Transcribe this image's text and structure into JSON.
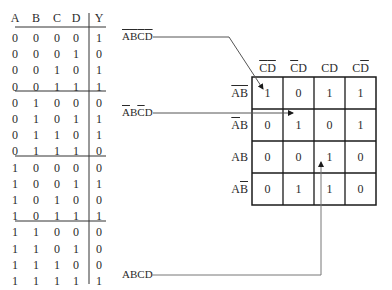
{
  "truth_table": {
    "headers": [
      "A",
      "B",
      "C",
      "D",
      "Y"
    ],
    "rows": [
      [
        "0",
        "0",
        "0",
        "0",
        "1"
      ],
      [
        "0",
        "0",
        "0",
        "1",
        "0"
      ],
      [
        "0",
        "0",
        "1",
        "0",
        "1"
      ],
      [
        "0",
        "0",
        "1",
        "1",
        "1"
      ],
      [
        "0",
        "1",
        "0",
        "0",
        "0"
      ],
      [
        "0",
        "1",
        "0",
        "1",
        "1"
      ],
      [
        "0",
        "1",
        "1",
        "0",
        "1"
      ],
      [
        "0",
        "1",
        "1",
        "1",
        "0"
      ],
      [
        "1",
        "0",
        "0",
        "0",
        "0"
      ],
      [
        "1",
        "0",
        "0",
        "1",
        "1"
      ],
      [
        "1",
        "0",
        "1",
        "0",
        "0"
      ],
      [
        "1",
        "0",
        "1",
        "1",
        "1"
      ],
      [
        "1",
        "1",
        "0",
        "0",
        "0"
      ],
      [
        "1",
        "1",
        "0",
        "1",
        "0"
      ],
      [
        "1",
        "1",
        "1",
        "0",
        "0"
      ],
      [
        "1",
        "1",
        "1",
        "1",
        "1"
      ]
    ]
  },
  "kmap": {
    "col_headers": [
      {
        "parts": [
          {
            "t": "C",
            "bar": true
          },
          {
            "t": "D",
            "bar": true
          }
        ],
        "text": "C̄D̄"
      },
      {
        "parts": [
          {
            "t": "C",
            "bar": true
          },
          {
            "t": "D",
            "bar": false
          }
        ],
        "text": "C̄D"
      },
      {
        "parts": [
          {
            "t": "C",
            "bar": false
          },
          {
            "t": "D",
            "bar": false
          }
        ],
        "text": "CD"
      },
      {
        "parts": [
          {
            "t": "C",
            "bar": false
          },
          {
            "t": "D",
            "bar": true
          }
        ],
        "text": "CD̄"
      }
    ],
    "row_headers": [
      {
        "parts": [
          {
            "t": "A",
            "bar": true
          },
          {
            "t": "B",
            "bar": true
          }
        ],
        "text": "ĀB̄"
      },
      {
        "parts": [
          {
            "t": "A",
            "bar": true
          },
          {
            "t": "B",
            "bar": false
          }
        ],
        "text": "ĀB"
      },
      {
        "parts": [
          {
            "t": "A",
            "bar": false
          },
          {
            "t": "B",
            "bar": false
          }
        ],
        "text": "AB"
      },
      {
        "parts": [
          {
            "t": "A",
            "bar": false
          },
          {
            "t": "B",
            "bar": true
          }
        ],
        "text": "AB̄"
      }
    ],
    "cells": [
      [
        "1",
        "0",
        "1",
        "1"
      ],
      [
        "0",
        "1",
        "0",
        "1"
      ],
      [
        "0",
        "0",
        "1",
        "0"
      ],
      [
        "0",
        "1",
        "1",
        "0"
      ]
    ]
  },
  "annotations": [
    {
      "label": "ĀB̄C̄D̄",
      "parts": [
        {
          "t": "A",
          "bar": true
        },
        {
          "t": "B",
          "bar": true
        },
        {
          "t": "C",
          "bar": true
        },
        {
          "t": "D",
          "bar": true
        }
      ],
      "target": "row ĀB̄, col C̄D̄"
    },
    {
      "label": "ĀBC̄D",
      "parts": [
        {
          "t": "A",
          "bar": true
        },
        {
          "t": "B",
          "bar": false
        },
        {
          "t": "C",
          "bar": true
        },
        {
          "t": "D",
          "bar": false
        }
      ],
      "target": "row ĀB, col C̄D"
    },
    {
      "label": "ABCD",
      "parts": [
        {
          "t": "A",
          "bar": false
        },
        {
          "t": "B",
          "bar": false
        },
        {
          "t": "C",
          "bar": false
        },
        {
          "t": "D",
          "bar": false
        }
      ],
      "target": "row AB, col CD"
    }
  ],
  "colors": {
    "ink": "#2a2a2a",
    "grid": "#1a1a1a",
    "arrow": "#555555"
  }
}
